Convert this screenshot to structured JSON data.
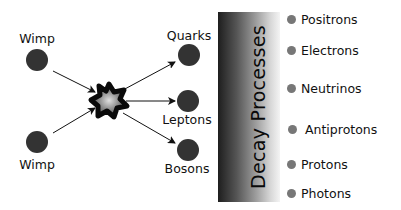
{
  "diagram": {
    "inputs": [
      {
        "label": "Wimp"
      },
      {
        "label": "Wimp"
      }
    ],
    "annihilation_icon": "explosion-star-icon",
    "products": [
      {
        "label": "Quarks"
      },
      {
        "label": "Leptons"
      },
      {
        "label": "Bosons"
      }
    ],
    "stage_label": "Decay Processes",
    "decay_products": [
      {
        "label": "Positrons"
      },
      {
        "label": "Electrons"
      },
      {
        "label": "Neutrinos"
      },
      {
        "label": "Antiprotons"
      },
      {
        "label": "Protons"
      },
      {
        "label": "Photons"
      }
    ],
    "colors": {
      "node": "#333333",
      "bullet": "#777777",
      "arrow": "#111111",
      "gradient_dark": "#1e1e1e",
      "gradient_light": "#f4f4f4"
    }
  }
}
